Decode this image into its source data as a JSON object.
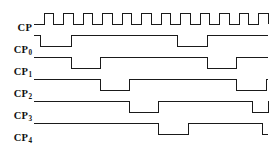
{
  "diagram": {
    "type": "digital-timing-waveform",
    "background_color": "#ffffff",
    "line_color": "#1a1a1a",
    "label_color": "#111111",
    "plot_area": {
      "x_start": 34,
      "x_end": 268,
      "width": 234
    },
    "clock_period_px": 19.5,
    "clock_cycles": 12,
    "signals": [
      {
        "name": "CP",
        "label_base": "CP",
        "label_sub": "",
        "row_y_high": 13,
        "row_y_low": 24,
        "description": "master clock, 12 pulses, 50% duty",
        "edges": [
          0,
          0,
          0.52,
          1,
          1,
          0,
          1.52,
          1,
          2,
          0,
          2.52,
          1,
          3,
          0,
          3.52,
          1,
          4,
          0,
          4.52,
          1,
          5,
          0,
          5.52,
          1,
          6,
          0,
          6.52,
          1,
          7,
          0,
          7.52,
          1,
          8,
          0,
          8.52,
          1,
          9,
          0,
          9.52,
          1,
          10,
          0,
          10.52,
          1,
          11,
          0,
          11.52,
          1,
          12,
          0
        ]
      },
      {
        "name": "CP0",
        "label_base": "CP",
        "label_sub": "0",
        "row_y_high": 35,
        "row_y_low": 46,
        "description": "two narrow low pulses, one CP wide",
        "edges": [
          0,
          1,
          0.35,
          0,
          1.9,
          1,
          7.35,
          0,
          8.9,
          1,
          12,
          1
        ]
      },
      {
        "name": "CP1",
        "label_base": "CP",
        "label_sub": "1",
        "row_y_high": 57,
        "row_y_low": 68,
        "description": "two low pulses two CP wide, shifted right of CP0",
        "edges": [
          0,
          1,
          1.9,
          0,
          3.4,
          1,
          8.9,
          0,
          10.4,
          1,
          12,
          1
        ]
      },
      {
        "name": "CP2",
        "label_base": "CP",
        "label_sub": "2",
        "row_y_high": 79,
        "row_y_low": 90,
        "description": "two low pulses, shifted right of CP1",
        "edges": [
          0,
          1,
          3.4,
          0,
          4.9,
          1,
          10.4,
          0,
          11.9,
          1,
          12,
          1
        ]
      },
      {
        "name": "CP3",
        "label_base": "CP",
        "label_sub": "3",
        "row_y_high": 101,
        "row_y_low": 112,
        "description": "two low pulses, shifted right of CP2",
        "edges": [
          0,
          1,
          4.9,
          0,
          6.4,
          1,
          11.2,
          0,
          12.0,
          1,
          12,
          1
        ]
      },
      {
        "name": "CP4",
        "label_base": "CP",
        "label_sub": "4",
        "row_y_high": 123,
        "row_y_low": 134,
        "description": "one mid low pulse, falls low at right edge",
        "edges": [
          0,
          1,
          6.4,
          0,
          7.9,
          1,
          11.7,
          0,
          12,
          0
        ]
      }
    ]
  }
}
